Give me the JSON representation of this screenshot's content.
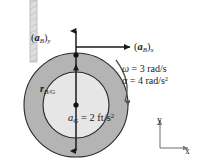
{
  "figure": {
    "colors": {
      "background": "#ffffff",
      "outer_ring_fill": "#b4b4b4",
      "inner_disk_fill": "#e6e6e6",
      "stroke": "#1a1a1a",
      "cord_fill": "#dcdcdc",
      "cord_stroke": "#9a9a9a"
    },
    "labels": {
      "accel_B_y": {
        "symbol": "a",
        "bracket_open": "(",
        "bracket_close": ")",
        "bold_vector": "a",
        "sub_vector": "B",
        "component": "y",
        "text": "(aB)y"
      },
      "accel_B_x": {
        "symbol": "a",
        "bracket_open": "(",
        "bracket_close": ")",
        "bold_vector": "a",
        "sub_vector": "B",
        "component": "x",
        "text": "(aB)x"
      },
      "position_r_BG": {
        "bold_vector": "r",
        "subscript": "B/G",
        "text": "rB/G"
      },
      "accel_G": {
        "symbol": "a",
        "subscript": "G",
        "equals": "=",
        "value": "2",
        "units": "ft/s",
        "units_exponent": "2",
        "text": "aG = 2 ft/s2"
      },
      "angular_velocity": {
        "symbol": "ω",
        "equals": "=",
        "value": "3",
        "units": "rad/s",
        "units_exponent": "",
        "text": "ω = 3 rad/s"
      },
      "angular_acceleration": {
        "symbol": "α",
        "equals": "=",
        "value": "4",
        "units": "rad/s",
        "units_exponent": "2",
        "text": "α = 4 rad/s2"
      },
      "axis_y": "y",
      "axis_x": "x"
    },
    "points": {
      "B": {
        "name": "point-B",
        "x": 76,
        "y": 56
      },
      "G": {
        "name": "point-G",
        "x": 76,
        "y": 105
      }
    },
    "geometry": {
      "outer_radius": 52,
      "inner_radius": 33,
      "center_x": 76,
      "center_y": 105
    },
    "arrows": {
      "vertical": {
        "name": "vertical-double-arrow",
        "from_y": 30,
        "to_y": 152
      },
      "horizontal": {
        "name": "horizontal-arrow-aBx",
        "from_x": 76,
        "to_x": 132,
        "y": 47
      },
      "curved": {
        "name": "curved-rotation-arrow",
        "direction": "clockwise"
      }
    },
    "cord": {
      "name": "vertical-cord",
      "x": 33,
      "top": 0,
      "bottom": 62
    }
  }
}
